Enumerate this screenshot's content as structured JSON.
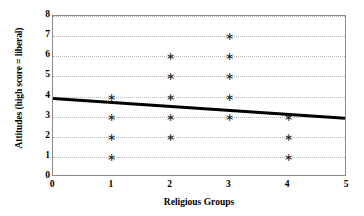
{
  "chart_data": {
    "type": "scatter",
    "title": "",
    "xlabel": "Religious Groups",
    "ylabel": "Attitudes (high score = liberal)",
    "xlim": [
      0,
      5
    ],
    "ylim": [
      0,
      8
    ],
    "xticks": [
      0,
      1,
      2,
      3,
      4,
      5
    ],
    "yticks": [
      0,
      1,
      2,
      3,
      4,
      5,
      6,
      7,
      8
    ],
    "grid": "horizontal-dotted",
    "legend": "none",
    "marker": "asterisk-star",
    "marker_glyph": "∗",
    "marker_color": "#1a1a1a",
    "points": [
      {
        "x": 1,
        "y": 4
      },
      {
        "x": 1,
        "y": 3
      },
      {
        "x": 1,
        "y": 2
      },
      {
        "x": 1,
        "y": 1
      },
      {
        "x": 2,
        "y": 6
      },
      {
        "x": 2,
        "y": 5
      },
      {
        "x": 2,
        "y": 4
      },
      {
        "x": 2,
        "y": 3
      },
      {
        "x": 2,
        "y": 2
      },
      {
        "x": 3,
        "y": 7
      },
      {
        "x": 3,
        "y": 6
      },
      {
        "x": 3,
        "y": 5
      },
      {
        "x": 3,
        "y": 4
      },
      {
        "x": 3,
        "y": 3
      },
      {
        "x": 4,
        "y": 3
      },
      {
        "x": 4,
        "y": 2
      },
      {
        "x": 4,
        "y": 1
      }
    ],
    "trendline": {
      "type": "linear-fit",
      "x_start": 0,
      "y_start": 3.85,
      "x_end": 5,
      "y_end": 2.85,
      "color": "#000000",
      "width_px": 3
    },
    "axis_color": "#8a8a8a",
    "grid_color": "#b8b8b8",
    "background": "#ffffff"
  }
}
